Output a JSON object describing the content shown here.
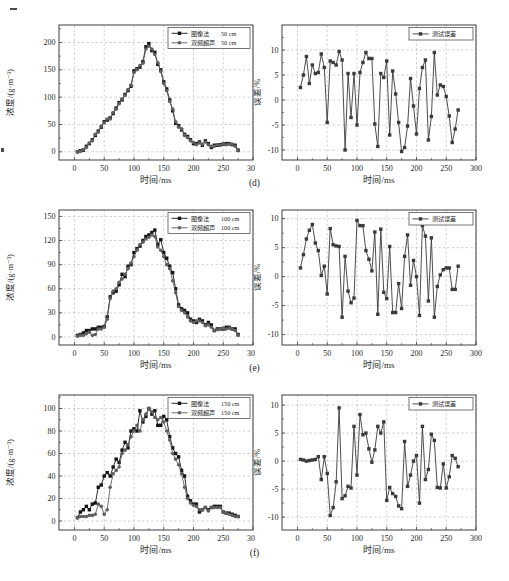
{
  "figure": {
    "row_labels": [
      "(d)",
      "(e)",
      "(f)"
    ],
    "colors": {
      "series1": "#141414",
      "series2": "#5f5f5f",
      "error": "#3a3a3a",
      "axis": "#3f3f3f",
      "grid": "#b2b2b2",
      "text": "#1f1f1f",
      "legend_border": "#555555",
      "background": "#ffffff"
    }
  },
  "chart_data": [
    {
      "id": "d-concentration",
      "type": "line",
      "column": "left",
      "title": "",
      "xlabel": "时间/ms",
      "ylabel": "浓度/(g·m⁻³)",
      "xlim": [
        -26,
        300
      ],
      "ylim": [
        -15,
        232
      ],
      "xticks": [
        0,
        50,
        100,
        150,
        200,
        250,
        300
      ],
      "yticks": [
        0,
        50,
        100,
        150,
        200
      ],
      "xminor": 25,
      "yminor": 25,
      "grid": "dashed",
      "legend_position": "top-right",
      "x": [
        5,
        10,
        15,
        20,
        25,
        30,
        35,
        40,
        45,
        50,
        55,
        60,
        65,
        70,
        75,
        80,
        85,
        90,
        95,
        100,
        105,
        110,
        115,
        120,
        125,
        130,
        135,
        140,
        145,
        150,
        155,
        160,
        165,
        170,
        175,
        180,
        185,
        190,
        195,
        200,
        205,
        210,
        215,
        220,
        225,
        230,
        235,
        240,
        245,
        250,
        255,
        260,
        265,
        270,
        275
      ],
      "series": [
        {
          "name": "图像法",
          "tag": "50 cm",
          "marker": "square",
          "color": "series1",
          "values": [
            0,
            2,
            3,
            10,
            15,
            22,
            30,
            38,
            45,
            55,
            58,
            62,
            70,
            80,
            90,
            95,
            105,
            112,
            120,
            148,
            152,
            155,
            165,
            192,
            198,
            185,
            182,
            160,
            150,
            128,
            115,
            95,
            75,
            52,
            48,
            40,
            32,
            28,
            22,
            15,
            15,
            18,
            12,
            20,
            15,
            8,
            12,
            12,
            13,
            14,
            15,
            15,
            13,
            12,
            3
          ]
        },
        {
          "name": "双频超声",
          "tag": "50 cm",
          "marker": "circle",
          "color": "series2",
          "values": [
            0,
            1,
            4,
            8,
            16,
            20,
            32,
            36,
            47,
            53,
            60,
            60,
            72,
            78,
            88,
            97,
            103,
            114,
            122,
            145,
            150,
            158,
            162,
            188,
            193,
            188,
            178,
            163,
            147,
            125,
            112,
            92,
            78,
            55,
            45,
            42,
            30,
            26,
            20,
            17,
            13,
            16,
            14,
            18,
            13,
            10,
            10,
            13,
            12,
            15,
            13,
            14,
            14,
            10,
            2
          ]
        }
      ]
    },
    {
      "id": "d-error",
      "type": "line",
      "column": "right",
      "title": "",
      "xlabel": "时间/ms",
      "ylabel": "误差/%",
      "xlim": [
        -26,
        300
      ],
      "ylim": [
        -12,
        15
      ],
      "xticks": [
        0,
        50,
        100,
        150,
        200,
        250,
        300
      ],
      "yticks": [
        -10,
        -5,
        0,
        5,
        10
      ],
      "xminor": 25,
      "yminor": 2.5,
      "grid": "dashed",
      "legend_position": "top-right",
      "x": [
        5,
        10,
        15,
        20,
        25,
        30,
        35,
        40,
        45,
        50,
        55,
        60,
        65,
        70,
        75,
        80,
        85,
        90,
        95,
        100,
        105,
        110,
        115,
        120,
        125,
        130,
        135,
        140,
        145,
        150,
        155,
        160,
        165,
        170,
        175,
        180,
        185,
        190,
        195,
        200,
        205,
        210,
        215,
        220,
        225,
        230,
        235,
        240,
        245,
        250,
        255,
        260,
        265,
        270
      ],
      "series": [
        {
          "name": "测试误差",
          "tag": "",
          "marker": "square",
          "color": "error",
          "values": [
            2.5,
            5,
            8.7,
            3.3,
            7,
            5.3,
            5.5,
            9.2,
            6.5,
            -4.5,
            7.8,
            7.5,
            7,
            9.7,
            8,
            -10,
            5.3,
            -3.5,
            5.3,
            -5,
            5.5,
            7.5,
            9.5,
            8.3,
            8.3,
            -4.8,
            -9.3,
            5.3,
            4.5,
            7.8,
            -7,
            5.8,
            1.2,
            -4.5,
            -10.3,
            -9.5,
            -5.2,
            4.3,
            -1.2,
            -6.8,
            2.3,
            6.5,
            8,
            -8,
            -3.3,
            9.5,
            1,
            3,
            2.7,
            0.7,
            -3.2,
            -8.5,
            -5.8,
            -2
          ]
        }
      ]
    },
    {
      "id": "e-concentration",
      "type": "line",
      "column": "left",
      "title": "",
      "xlabel": "时间/ms",
      "ylabel": "浓度/(g·m⁻³)",
      "xlim": [
        -26,
        300
      ],
      "ylim": [
        -10,
        158
      ],
      "xticks": [
        0,
        50,
        100,
        150,
        200,
        250,
        300
      ],
      "yticks": [
        0,
        30,
        60,
        90,
        120,
        150
      ],
      "xminor": 25,
      "yminor": 15,
      "grid": "dashed",
      "legend_position": "top-right",
      "x": [
        5,
        10,
        15,
        20,
        25,
        30,
        35,
        40,
        45,
        50,
        55,
        60,
        65,
        70,
        75,
        80,
        85,
        90,
        95,
        100,
        105,
        110,
        115,
        120,
        125,
        130,
        135,
        140,
        145,
        150,
        155,
        160,
        165,
        170,
        175,
        180,
        185,
        190,
        195,
        200,
        205,
        210,
        215,
        220,
        225,
        230,
        235,
        240,
        245,
        250,
        255,
        260,
        265,
        270,
        275
      ],
      "series": [
        {
          "name": "图像法",
          "tag": "100 cm",
          "marker": "square",
          "color": "series1",
          "values": [
            2,
            3,
            5,
            8,
            8,
            10,
            10,
            12,
            12,
            13,
            25,
            50,
            55,
            57,
            65,
            78,
            75,
            88,
            90,
            105,
            110,
            113,
            120,
            125,
            127,
            130,
            133,
            115,
            121,
            105,
            98,
            88,
            80,
            60,
            40,
            35,
            33,
            30,
            22,
            20,
            18,
            22,
            20,
            15,
            18,
            15,
            8,
            10,
            10,
            10,
            12,
            12,
            10,
            10,
            3
          ]
        },
        {
          "name": "双频超声",
          "tag": "100 cm",
          "marker": "circle",
          "color": "series2",
          "values": [
            1,
            2,
            2,
            4,
            6,
            2,
            3,
            10,
            10,
            12,
            22,
            48,
            57,
            60,
            68,
            72,
            78,
            85,
            92,
            100,
            108,
            115,
            118,
            122,
            124,
            127,
            125,
            112,
            108,
            100,
            90,
            85,
            70,
            55,
            38,
            33,
            30,
            25,
            20,
            18,
            20,
            20,
            18,
            14,
            15,
            12,
            8,
            9,
            10,
            11,
            10,
            11,
            10,
            8,
            2
          ]
        }
      ]
    },
    {
      "id": "e-error",
      "type": "line",
      "column": "right",
      "title": "",
      "xlabel": "时间/ms",
      "ylabel": "误差/%",
      "xlim": [
        -26,
        300
      ],
      "ylim": [
        -11.8,
        11.5
      ],
      "xticks": [
        0,
        50,
        100,
        150,
        200,
        250,
        300
      ],
      "yticks": [
        -10,
        -5,
        0,
        5,
        10
      ],
      "xminor": 25,
      "yminor": 2.5,
      "grid": "dashed",
      "legend_position": "top-right",
      "x": [
        5,
        10,
        15,
        20,
        25,
        30,
        35,
        40,
        45,
        50,
        55,
        60,
        65,
        70,
        75,
        80,
        85,
        90,
        95,
        100,
        105,
        110,
        115,
        120,
        125,
        130,
        135,
        140,
        145,
        150,
        155,
        160,
        165,
        170,
        175,
        180,
        185,
        190,
        195,
        200,
        205,
        210,
        215,
        220,
        225,
        230,
        235,
        240,
        245,
        250,
        255,
        260,
        265,
        270
      ],
      "series": [
        {
          "name": "测试误差",
          "tag": "",
          "marker": "square",
          "color": "error",
          "values": [
            1.5,
            3.8,
            6.5,
            8,
            9,
            5.8,
            4.5,
            0.2,
            1.8,
            -3,
            8.3,
            5.5,
            5.3,
            5.2,
            -7,
            3.5,
            -2.5,
            -4.5,
            -3.7,
            9.7,
            8.8,
            8.8,
            4.5,
            3,
            1,
            7.7,
            -6.5,
            8.2,
            -2.7,
            -3.8,
            5.2,
            -6.2,
            -6.2,
            -1.2,
            -5.5,
            3.5,
            7.2,
            -1.5,
            2.8,
            0,
            -6.7,
            8.8,
            7,
            -4.2,
            6.7,
            -7,
            -1.7,
            0.3,
            1.2,
            1.5,
            1.5,
            -2.2,
            -2.2,
            1.8
          ]
        }
      ]
    },
    {
      "id": "f-concentration",
      "type": "line",
      "column": "left",
      "title": "",
      "xlabel": "时间/ms",
      "ylabel": "浓度/(g·m⁻³)",
      "xlim": [
        -26,
        300
      ],
      "ylim": [
        -8,
        112
      ],
      "xticks": [
        0,
        50,
        100,
        150,
        200,
        250,
        300
      ],
      "yticks": [
        0,
        20,
        40,
        60,
        80,
        100
      ],
      "xminor": 25,
      "yminor": 10,
      "grid": "dashed",
      "legend_position": "top-right",
      "x": [
        5,
        10,
        15,
        20,
        25,
        30,
        35,
        40,
        45,
        50,
        55,
        60,
        65,
        70,
        75,
        80,
        85,
        90,
        95,
        100,
        105,
        110,
        115,
        120,
        125,
        130,
        135,
        140,
        145,
        150,
        155,
        160,
        165,
        170,
        175,
        180,
        185,
        190,
        195,
        200,
        205,
        210,
        215,
        220,
        225,
        230,
        235,
        240,
        245,
        250,
        255,
        260,
        265,
        270,
        275
      ],
      "series": [
        {
          "name": "图像法",
          "tag": "150 cm",
          "marker": "square",
          "color": "series1",
          "values": [
            3,
            8,
            10,
            13,
            10,
            15,
            16,
            30,
            32,
            40,
            43,
            40,
            48,
            55,
            52,
            63,
            70,
            65,
            80,
            82,
            80,
            98,
            88,
            93,
            100,
            95,
            98,
            85,
            85,
            93,
            90,
            75,
            65,
            60,
            57,
            45,
            40,
            22,
            18,
            15,
            15,
            8,
            10,
            12,
            10,
            12,
            13,
            13,
            13,
            8,
            7,
            7,
            6,
            5,
            4
          ]
        },
        {
          "name": "双频超声",
          "tag": "150 cm",
          "marker": "circle",
          "color": "series2",
          "values": [
            3,
            4,
            4,
            4,
            5,
            5,
            6,
            15,
            13,
            6,
            10,
            30,
            42,
            45,
            48,
            60,
            63,
            68,
            75,
            80,
            85,
            80,
            90,
            95,
            100,
            97,
            92,
            90,
            92,
            88,
            80,
            72,
            60,
            55,
            50,
            42,
            30,
            20,
            16,
            14,
            13,
            10,
            10,
            12,
            9,
            12,
            12,
            12,
            12,
            8,
            7,
            6,
            5,
            4,
            4
          ]
        }
      ]
    },
    {
      "id": "f-error",
      "type": "line",
      "column": "right",
      "title": "",
      "xlabel": "时间/ms",
      "ylabel": "误差/%",
      "xlim": [
        -26,
        300
      ],
      "ylim": [
        -12.3,
        11.8
      ],
      "xticks": [
        0,
        50,
        100,
        150,
        200,
        250,
        300
      ],
      "yticks": [
        -10,
        -5,
        0,
        5,
        10
      ],
      "xminor": 25,
      "yminor": 2.5,
      "grid": "dashed",
      "legend_position": "top-right",
      "x": [
        5,
        10,
        15,
        20,
        25,
        30,
        35,
        40,
        45,
        50,
        55,
        60,
        65,
        70,
        75,
        80,
        85,
        90,
        95,
        100,
        105,
        110,
        115,
        120,
        125,
        130,
        135,
        140,
        145,
        150,
        155,
        160,
        165,
        170,
        175,
        180,
        185,
        190,
        195,
        200,
        205,
        210,
        215,
        220,
        225,
        230,
        235,
        240,
        245,
        250,
        255,
        260,
        265,
        270
      ],
      "series": [
        {
          "name": "测试误差",
          "tag": "",
          "marker": "square",
          "color": "error",
          "values": [
            0.3,
            0.2,
            0,
            0.1,
            0.2,
            0.3,
            0.8,
            -3.3,
            0.8,
            -2.2,
            -9.7,
            -8.3,
            -3.7,
            9.5,
            -6.7,
            -6.2,
            -4.5,
            -4.8,
            6.2,
            -2.5,
            8.3,
            4.7,
            5,
            2.2,
            -0.2,
            2,
            6.2,
            5,
            7,
            -7,
            -4.7,
            -5.8,
            -6.3,
            -8,
            -8.5,
            3.5,
            -4.5,
            -2.5,
            0,
            1,
            -7.5,
            6.2,
            -3.3,
            -1.5,
            4.8,
            3.7,
            -4.7,
            -4.8,
            -0.5,
            -4.8,
            -2.8,
            1,
            0.5,
            -1
          ]
        }
      ]
    }
  ]
}
